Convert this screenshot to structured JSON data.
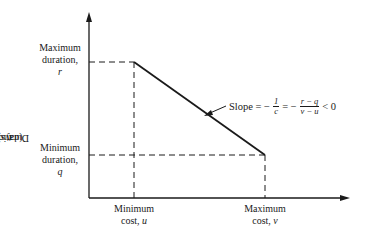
{
  "diagram": {
    "type": "cost-duration tradeoff",
    "y_axis": {
      "label_prefix": "Duration, ",
      "label_var": "t",
      "label_suffix": " (days)"
    },
    "labels": {
      "max_duration": {
        "line1": "Maximum",
        "line2": "duration,",
        "var": "r"
      },
      "min_duration": {
        "line1": "Minimum",
        "line2": "duration,",
        "var": "q"
      },
      "min_cost": {
        "line1": "Minimum",
        "line2": "cost, ",
        "var": "u"
      },
      "max_cost": {
        "line1": "Maximum",
        "line2": "cost, ",
        "var": "v"
      }
    },
    "slope": {
      "text": "Slope = −",
      "frac1_num": "1",
      "frac1_den": "c",
      "eq": "= −",
      "frac2_num": "r − q",
      "frac2_den": "v − u",
      "tail": "< 0"
    },
    "points": {
      "start": {
        "cost": "u",
        "duration": "r"
      },
      "end": {
        "cost": "v",
        "duration": "q"
      }
    },
    "colors": {
      "line": "#1a1a1a",
      "background": "#ffffff"
    }
  }
}
